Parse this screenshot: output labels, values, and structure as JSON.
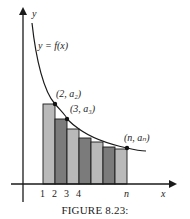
{
  "figure": {
    "caption": "FIGURE 8.23:",
    "axis_labels": {
      "x": "x",
      "y": "y"
    },
    "curve_label": "y = f(x)",
    "point_labels": [
      "(2, a₂)",
      "(3, a₃)",
      "(n, aₙ)"
    ],
    "tick_labels": [
      "1",
      "2",
      "3",
      "4",
      "n"
    ],
    "colors": {
      "bar_light": "#b9b9b9",
      "bar_dark": "#7b7b7b",
      "outline": "#1a1a1a"
    }
  },
  "bars": [
    {
      "x": 43,
      "top": 104,
      "shade": "light"
    },
    {
      "x": 55,
      "top": 119,
      "shade": "dark"
    },
    {
      "x": 67,
      "top": 129,
      "shade": "light"
    },
    {
      "x": 79,
      "top": 138,
      "shade": "dark"
    },
    {
      "x": 91,
      "top": 142,
      "shade": "light"
    },
    {
      "x": 103,
      "top": 147,
      "shade": "dark"
    },
    {
      "x": 115,
      "top": 149,
      "shade": "light"
    }
  ]
}
